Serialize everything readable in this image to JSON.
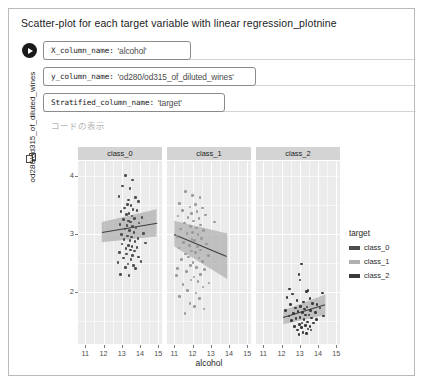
{
  "cell": {
    "form_title": "Scatter-plot for each target variable with linear regression_plotnine",
    "run_button_name": "run-cell-button",
    "show_code_label": "コードの表示"
  },
  "params": [
    {
      "key": "X_column_name:",
      "value": "'alcohol'",
      "name": "x-column-name"
    },
    {
      "key": "y_column_name:",
      "value": "'od280/od315_of_diluted_wines'",
      "name": "y-column-name"
    },
    {
      "key": "Stratified_column_name:",
      "value": "'target'",
      "name": "stratified-column-name"
    }
  ],
  "chart_data": {
    "type": "scatter",
    "title": "",
    "xlabel": "alcohol",
    "ylabel": "od280/od315_of_diluted_wines",
    "xlim": [
      10.6,
      15.2
    ],
    "ylim": [
      1.1,
      4.25
    ],
    "xticks": [
      11,
      12,
      13,
      14,
      15
    ],
    "yticks": [
      2,
      3,
      4
    ],
    "grid": true,
    "legend": {
      "title": "target",
      "position": "right",
      "entries": [
        {
          "label": "class_0",
          "color": "#4d4d4d"
        },
        {
          "label": "class_1",
          "color": "#b0b0b0"
        },
        {
          "label": "class_2",
          "color": "#3a3a3a"
        }
      ]
    },
    "facet_variable": "target",
    "facets": [
      {
        "label": "class_0",
        "point_color": "#4d4d4d",
        "fit": {
          "x0": 11.9,
          "y0": 3.02,
          "x1": 14.9,
          "y1": 3.18
        },
        "ci_band": {
          "x0": 11.9,
          "x1": 14.9,
          "upper0": 3.2,
          "upper1": 3.42,
          "lower0": 2.85,
          "lower1": 2.95
        },
        "points": [
          [
            13.2,
            4.0
          ],
          [
            13.6,
            3.92
          ],
          [
            13.05,
            3.82
          ],
          [
            13.45,
            3.78
          ],
          [
            12.85,
            3.64
          ],
          [
            13.75,
            3.62
          ],
          [
            13.35,
            3.58
          ],
          [
            13.9,
            3.55
          ],
          [
            13.3,
            3.5
          ],
          [
            13.5,
            3.48
          ],
          [
            13.15,
            3.44
          ],
          [
            13.62,
            3.42
          ],
          [
            13.82,
            3.4
          ],
          [
            12.95,
            3.38
          ],
          [
            13.4,
            3.35
          ],
          [
            13.25,
            3.33
          ],
          [
            13.55,
            3.3
          ],
          [
            14.1,
            3.28
          ],
          [
            13.7,
            3.26
          ],
          [
            13.08,
            3.24
          ],
          [
            13.38,
            3.22
          ],
          [
            13.48,
            3.2
          ],
          [
            13.95,
            3.18
          ],
          [
            12.9,
            3.16
          ],
          [
            13.28,
            3.14
          ],
          [
            13.58,
            3.12
          ],
          [
            13.78,
            3.1
          ],
          [
            13.18,
            3.08
          ],
          [
            13.42,
            3.05
          ],
          [
            13.66,
            3.02
          ],
          [
            14.2,
            3.0
          ],
          [
            12.98,
            2.98
          ],
          [
            13.32,
            2.96
          ],
          [
            13.52,
            2.94
          ],
          [
            13.88,
            2.92
          ],
          [
            13.12,
            2.9
          ],
          [
            13.44,
            2.88
          ],
          [
            13.72,
            2.86
          ],
          [
            14.3,
            2.84
          ],
          [
            13.02,
            2.82
          ],
          [
            13.36,
            2.8
          ],
          [
            13.56,
            2.78
          ],
          [
            13.84,
            2.76
          ],
          [
            13.22,
            2.74
          ],
          [
            13.46,
            2.72
          ],
          [
            13.68,
            2.7
          ],
          [
            12.88,
            2.68
          ],
          [
            13.26,
            2.65
          ],
          [
            13.6,
            2.62
          ],
          [
            13.92,
            2.6
          ],
          [
            13.1,
            2.58
          ],
          [
            13.5,
            2.55
          ],
          [
            14.05,
            2.52
          ],
          [
            12.8,
            2.5
          ],
          [
            13.34,
            2.48
          ],
          [
            13.64,
            2.45
          ],
          [
            13.2,
            2.42
          ],
          [
            13.74,
            2.4
          ],
          [
            12.93,
            2.3
          ],
          [
            13.4,
            2.28
          ]
        ]
      },
      {
        "label": "class_1",
        "point_color": "#9a9a9a",
        "fit": {
          "x0": 11.0,
          "y0": 3.0,
          "x1": 13.9,
          "y1": 2.62
        },
        "ci_band": {
          "x0": 11.0,
          "x1": 13.9,
          "upper0": 3.22,
          "upper1": 3.0,
          "lower0": 2.78,
          "lower1": 2.22
        },
        "points": [
          [
            11.6,
            3.72
          ],
          [
            12.0,
            3.66
          ],
          [
            12.4,
            3.62
          ],
          [
            11.3,
            3.52
          ],
          [
            12.15,
            3.5
          ],
          [
            11.85,
            3.46
          ],
          [
            12.55,
            3.44
          ],
          [
            11.45,
            3.4
          ],
          [
            12.25,
            3.38
          ],
          [
            11.95,
            3.35
          ],
          [
            12.7,
            3.32
          ],
          [
            11.2,
            3.3
          ],
          [
            11.75,
            3.28
          ],
          [
            12.35,
            3.26
          ],
          [
            12.05,
            3.22
          ],
          [
            13.2,
            3.2
          ],
          [
            11.55,
            3.18
          ],
          [
            12.45,
            3.15
          ],
          [
            11.9,
            3.12
          ],
          [
            12.2,
            3.1
          ],
          [
            11.35,
            3.08
          ],
          [
            12.6,
            3.05
          ],
          [
            12.0,
            3.02
          ],
          [
            11.7,
            3.0
          ],
          [
            12.3,
            2.98
          ],
          [
            11.15,
            2.95
          ],
          [
            12.5,
            2.92
          ],
          [
            11.98,
            2.9
          ],
          [
            12.1,
            2.88
          ],
          [
            11.5,
            2.85
          ],
          [
            12.75,
            2.82
          ],
          [
            11.82,
            2.8
          ],
          [
            12.28,
            2.78
          ],
          [
            11.25,
            2.75
          ],
          [
            12.42,
            2.72
          ],
          [
            11.95,
            2.7
          ],
          [
            12.15,
            2.68
          ],
          [
            11.62,
            2.65
          ],
          [
            12.88,
            2.62
          ],
          [
            11.78,
            2.6
          ],
          [
            12.35,
            2.58
          ],
          [
            11.4,
            2.55
          ],
          [
            12.55,
            2.52
          ],
          [
            12.02,
            2.5
          ],
          [
            11.88,
            2.45
          ],
          [
            12.22,
            2.42
          ],
          [
            11.18,
            2.4
          ],
          [
            12.65,
            2.38
          ],
          [
            11.68,
            2.35
          ],
          [
            12.45,
            2.3
          ],
          [
            11.12,
            2.28
          ],
          [
            12.08,
            2.25
          ],
          [
            11.92,
            2.2
          ],
          [
            12.3,
            2.18
          ],
          [
            11.48,
            2.12
          ],
          [
            12.58,
            2.08
          ],
          [
            11.72,
            2.02
          ],
          [
            12.18,
            1.98
          ],
          [
            12.9,
            2.15
          ],
          [
            11.28,
            1.92
          ],
          [
            12.38,
            1.88
          ],
          [
            11.85,
            1.8
          ],
          [
            12.12,
            1.75
          ],
          [
            12.62,
            1.7
          ],
          [
            11.58,
            1.62
          ]
        ]
      },
      {
        "label": "class_2",
        "point_color": "#3a3a3a",
        "fit": {
          "x0": 12.1,
          "y0": 1.56,
          "x1": 14.4,
          "y1": 1.78
        },
        "ci_band": {
          "x0": 12.1,
          "x1": 14.4,
          "upper0": 1.68,
          "upper1": 1.95,
          "lower0": 1.44,
          "lower1": 1.6
        },
        "points": [
          [
            13.1,
            2.48
          ],
          [
            12.95,
            2.3
          ],
          [
            13.0,
            2.2
          ],
          [
            12.45,
            2.05
          ],
          [
            13.45,
            2.02
          ],
          [
            13.35,
            2.0
          ],
          [
            12.6,
            1.96
          ],
          [
            14.25,
            1.98
          ],
          [
            12.3,
            1.9
          ],
          [
            13.55,
            1.88
          ],
          [
            12.85,
            1.85
          ],
          [
            13.2,
            1.82
          ],
          [
            13.7,
            1.8
          ],
          [
            12.5,
            1.78
          ],
          [
            13.95,
            1.78
          ],
          [
            13.05,
            1.75
          ],
          [
            13.4,
            1.74
          ],
          [
            12.75,
            1.72
          ],
          [
            14.1,
            1.72
          ],
          [
            13.25,
            1.7
          ],
          [
            12.2,
            1.68
          ],
          [
            13.6,
            1.68
          ],
          [
            12.9,
            1.66
          ],
          [
            13.15,
            1.64
          ],
          [
            13.85,
            1.64
          ],
          [
            12.65,
            1.62
          ],
          [
            13.3,
            1.6
          ],
          [
            13.5,
            1.6
          ],
          [
            12.4,
            1.58
          ],
          [
            14.3,
            1.58
          ],
          [
            13.0,
            1.56
          ],
          [
            13.65,
            1.55
          ],
          [
            12.8,
            1.54
          ],
          [
            13.22,
            1.52
          ],
          [
            13.9,
            1.52
          ],
          [
            12.55,
            1.5
          ],
          [
            13.42,
            1.48
          ],
          [
            13.12,
            1.46
          ],
          [
            13.75,
            1.46
          ],
          [
            12.98,
            1.44
          ],
          [
            13.32,
            1.42
          ],
          [
            12.7,
            1.4
          ],
          [
            13.55,
            1.4
          ],
          [
            13.08,
            1.38
          ],
          [
            13.45,
            1.36
          ],
          [
            12.88,
            1.34
          ],
          [
            13.62,
            1.34
          ],
          [
            13.18,
            1.3
          ],
          [
            13.38,
            1.28
          ],
          [
            12.95,
            1.26
          ]
        ]
      }
    ]
  }
}
